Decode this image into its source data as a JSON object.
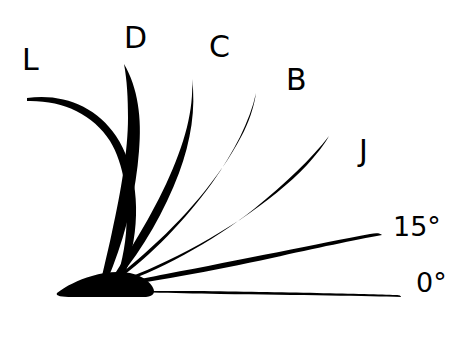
{
  "diagram": {
    "type": "lash-curl-fan-diagram",
    "background_color": "#ffffff",
    "stroke_color": "#000000",
    "canvas": {
      "width": 467,
      "height": 342
    },
    "origin": {
      "x": 100,
      "y": 284
    },
    "labels": [
      {
        "id": "curl-l",
        "text": "L",
        "kind": "letter",
        "x": 22,
        "y": 45,
        "curl": "L",
        "tip": {
          "x": 27,
          "y": 98
        }
      },
      {
        "id": "curl-d",
        "text": "D",
        "kind": "letter",
        "x": 124,
        "y": 23,
        "curl": "D",
        "tip": {
          "x": 124,
          "y": 64
        }
      },
      {
        "id": "curl-c",
        "text": "C",
        "kind": "letter",
        "x": 209,
        "y": 32,
        "curl": "C",
        "tip": {
          "x": 192,
          "y": 79
        }
      },
      {
        "id": "curl-b",
        "text": "B",
        "kind": "letter",
        "x": 286,
        "y": 65,
        "curl": "B",
        "tip": {
          "x": 256,
          "y": 93
        }
      },
      {
        "id": "curl-j",
        "text": "J",
        "kind": "letter",
        "x": 359,
        "y": 136,
        "curl": "J",
        "tip": {
          "x": 329,
          "y": 136
        }
      },
      {
        "id": "angle-15",
        "text": "15°",
        "kind": "angle",
        "x": 393,
        "y": 213,
        "curl": "15°",
        "tip": {
          "x": 382,
          "y": 235
        }
      },
      {
        "id": "angle-0",
        "text": "0°",
        "kind": "angle",
        "x": 416,
        "y": 269,
        "curl": "0°",
        "tip": {
          "x": 401,
          "y": 297
        }
      }
    ],
    "lashes": [
      {
        "id": "lash-l",
        "label": "L",
        "curl_degrees": 165
      },
      {
        "id": "lash-d",
        "label": "D",
        "curl_degrees": 120
      },
      {
        "id": "lash-c",
        "label": "C",
        "curl_degrees": 95
      },
      {
        "id": "lash-b",
        "label": "B",
        "curl_degrees": 70
      },
      {
        "id": "lash-j",
        "label": "J",
        "curl_degrees": 45
      },
      {
        "id": "lash-15",
        "label": "15°",
        "curl_degrees": 15
      },
      {
        "id": "lash-0",
        "label": "0°",
        "curl_degrees": 0
      }
    ]
  }
}
